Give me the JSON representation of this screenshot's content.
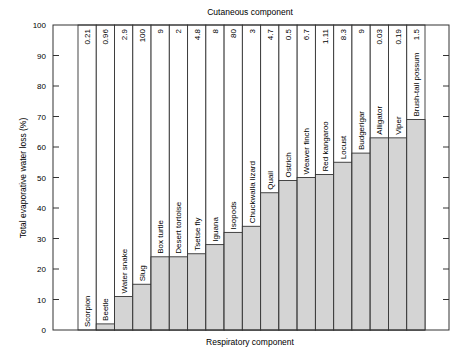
{
  "chart_data": {
    "type": "bar",
    "stacked": true,
    "title": "Cutaneous component",
    "xlabel": "Respiratory component",
    "ylabel": "Total evaporative water loss (%)",
    "ylim": [
      0,
      100
    ],
    "yticks": [
      0,
      10,
      20,
      30,
      40,
      50,
      60,
      70,
      80,
      90,
      100
    ],
    "grid": false,
    "categories": [
      "Scorpion",
      "Beetle",
      "Water snake",
      "Slug",
      "Box turtle",
      "Desert tortoise",
      "Tsetse fly",
      "Iguana",
      "Isopods",
      "Chuckwalla lizard",
      "Quail",
      "Ostrich",
      "Weaver finch",
      "Red kangaroo",
      "Locust",
      "Budgerigar",
      "Alligator",
      "Viper",
      "Brush-tail possum"
    ],
    "series": [
      {
        "name": "Respiratory component",
        "color": "#d4d4d4",
        "values": [
          0,
          2,
          11,
          15,
          24,
          24,
          25,
          28,
          32,
          34,
          45,
          49,
          50,
          51,
          55,
          58,
          63,
          63,
          69
        ]
      },
      {
        "name": "Cutaneous component",
        "color": "#ffffff",
        "values": [
          100,
          98,
          89,
          85,
          76,
          76,
          75,
          72,
          68,
          66,
          55,
          51,
          50,
          49,
          45,
          42,
          37,
          37,
          31
        ]
      }
    ],
    "top_labels": [
      "0.21",
      "0.96",
      "2.9",
      "100",
      "9",
      "2",
      "4.8",
      "8",
      "80",
      "3",
      "4.7",
      "0.5",
      "6.7",
      "1.11",
      "8.3",
      "9",
      "0.03",
      "0.19",
      "1.5"
    ]
  }
}
